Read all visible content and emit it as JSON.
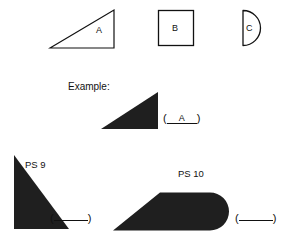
{
  "page": {
    "background_color": "#ffffff",
    "ink_color": "#111111",
    "fill_color": "#1f1f1f"
  },
  "key_row": {
    "shapes": [
      {
        "id": "shape-a",
        "label": "A",
        "kind": "right-triangle",
        "style": "outline",
        "description": "right triangle, right angle at bottom right, hypotenuse rising left to right"
      },
      {
        "id": "shape-b",
        "label": "B",
        "kind": "square",
        "style": "outline",
        "description": "square"
      },
      {
        "id": "shape-c",
        "label": "C",
        "kind": "semicircle",
        "style": "outline",
        "description": "semicircle, flat edge on the left, curve bulging right"
      }
    ]
  },
  "example": {
    "caption": "Example:",
    "shape": {
      "id": "example-shape",
      "kind": "right-triangle",
      "style": "filled",
      "description": "solid right triangle, right angle at bottom right"
    },
    "answer": {
      "open_paren": "(",
      "close_paren": ")",
      "value": "A",
      "filled": true
    }
  },
  "problems": [
    {
      "id": "ps-9",
      "label": "PS 9",
      "shape": {
        "id": "ps9-shape",
        "kind": "right-triangle",
        "style": "filled",
        "description": "solid right triangle, right angle at bottom left, apex at top left"
      },
      "answer": {
        "open_paren": "(",
        "close_paren": ")",
        "value": "",
        "filled": false
      }
    },
    {
      "id": "ps-10",
      "label": "PS 10",
      "shape": {
        "id": "ps10-shape",
        "kind": "wedge-with-round-end",
        "style": "filled",
        "description": "solid wedge with a sharp point at the left widening to a rounded semicircular right end"
      },
      "answer": {
        "open_paren": "(",
        "close_paren": ")",
        "value": "",
        "filled": false
      }
    }
  ]
}
